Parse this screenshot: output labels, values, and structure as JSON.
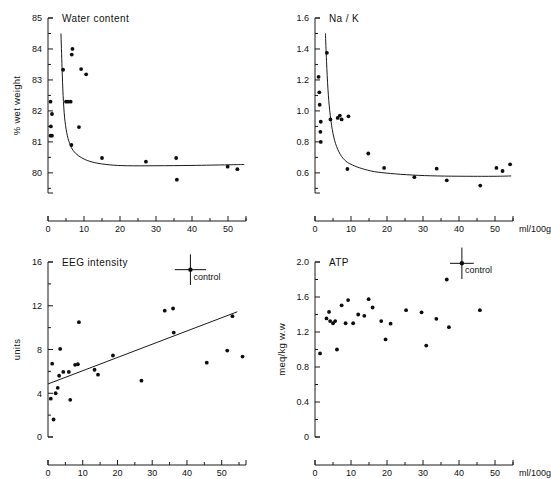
{
  "figure": {
    "width": 551,
    "height": 479,
    "background": "#ffffff",
    "ink": "#111111"
  },
  "chart_data": [
    {
      "panel": "top-left",
      "type": "scatter",
      "title": "Water content",
      "xlabel": "",
      "ylabel": "% wet weight",
      "xunit": "",
      "xlim": [
        0,
        55
      ],
      "ylim": [
        79.35,
        85
      ],
      "xticks": [
        0,
        10,
        20,
        30,
        40,
        50
      ],
      "xticklabels": [
        "0",
        "10",
        "20",
        "30",
        "40",
        "50"
      ],
      "xminorticks": [
        5,
        15,
        25,
        35,
        45,
        55
      ],
      "yticks": [
        80,
        81,
        82,
        83,
        84,
        85
      ],
      "yticklabels": [
        "80",
        "81",
        "82",
        "83",
        "84",
        "85"
      ],
      "yminorticks": [
        79.5,
        80.5,
        81.5,
        82.5,
        83.5,
        84.5
      ],
      "grid": false,
      "legend": "none",
      "points": [
        [
          0.7,
          82.3
        ],
        [
          1.1,
          81.9
        ],
        [
          0.8,
          81.5
        ],
        [
          0.7,
          81.2
        ],
        [
          1.1,
          81.2
        ],
        [
          4.2,
          83.33
        ],
        [
          5.0,
          82.3
        ],
        [
          5.6,
          82.3
        ],
        [
          6.3,
          82.3
        ],
        [
          6.8,
          84.0
        ],
        [
          6.6,
          83.82
        ],
        [
          6.5,
          80.9
        ],
        [
          9.2,
          83.35
        ],
        [
          10.6,
          83.18
        ],
        [
          8.6,
          81.48
        ],
        [
          15.0,
          80.48
        ],
        [
          27.2,
          80.36
        ],
        [
          35.6,
          80.48
        ],
        [
          35.8,
          79.78
        ],
        [
          49.9,
          80.2
        ],
        [
          52.6,
          80.12
        ]
      ],
      "fit": {
        "kind": "decay-curve",
        "description": "steep hyperbolic decay to plateau near 80.25",
        "asymptote": 80.25,
        "points": [
          [
            3.6,
            84.5
          ],
          [
            3.9,
            83.4
          ],
          [
            4.2,
            82.5
          ],
          [
            4.6,
            81.8
          ],
          [
            5.2,
            81.3
          ],
          [
            6.0,
            80.95
          ],
          [
            7.0,
            80.72
          ],
          [
            8.5,
            80.55
          ],
          [
            10.5,
            80.42
          ],
          [
            13.0,
            80.33
          ],
          [
            17.0,
            80.26
          ],
          [
            22.0,
            80.23
          ],
          [
            30.0,
            80.23
          ],
          [
            40.0,
            80.24
          ],
          [
            50.0,
            80.26
          ],
          [
            54.5,
            80.27
          ]
        ]
      }
    },
    {
      "panel": "top-right",
      "type": "scatter",
      "title": "Na / K",
      "xlabel": "ml/100g/min",
      "ylabel": "",
      "xunit": "ml/100g/min",
      "xlim": [
        0,
        55
      ],
      "ylim": [
        0.47,
        1.6
      ],
      "xticks": [
        0,
        10,
        20,
        30,
        40,
        50
      ],
      "xticklabels": [
        "0",
        "10",
        "20",
        "30",
        "40",
        "50"
      ],
      "xminorticks": [
        5,
        15,
        25,
        35,
        45,
        55
      ],
      "yticks": [
        0.6,
        0.8,
        1.0,
        1.2,
        1.4,
        1.6
      ],
      "yticklabels": [
        "0.6",
        "0.8",
        "1.0",
        "1.2",
        "1.4",
        "1.6"
      ],
      "yminorticks": [
        0.5,
        0.7,
        0.9,
        1.1,
        1.3,
        1.5
      ],
      "grid": false,
      "legend": "none",
      "points": [
        [
          1.0,
          1.22
        ],
        [
          1.2,
          1.12
        ],
        [
          1.3,
          1.04
        ],
        [
          1.6,
          0.93
        ],
        [
          1.5,
          0.865
        ],
        [
          1.6,
          0.8
        ],
        [
          3.3,
          1.375
        ],
        [
          4.3,
          0.945
        ],
        [
          6.3,
          0.955
        ],
        [
          6.9,
          0.97
        ],
        [
          7.4,
          0.945
        ],
        [
          9.3,
          0.965
        ],
        [
          9.0,
          0.625
        ],
        [
          14.8,
          0.725
        ],
        [
          19.2,
          0.632
        ],
        [
          27.6,
          0.572
        ],
        [
          33.8,
          0.627
        ],
        [
          36.6,
          0.552
        ],
        [
          45.9,
          0.518
        ],
        [
          50.4,
          0.632
        ],
        [
          52.1,
          0.612
        ],
        [
          54.2,
          0.655
        ]
      ],
      "fit": {
        "kind": "decay-curve",
        "description": "steep hyperbolic decay to plateau near 0.58",
        "asymptote": 0.58,
        "points": [
          [
            2.9,
            1.5
          ],
          [
            3.2,
            1.32
          ],
          [
            3.6,
            1.14
          ],
          [
            4.1,
            1.0
          ],
          [
            4.8,
            0.88
          ],
          [
            5.7,
            0.79
          ],
          [
            7.0,
            0.72
          ],
          [
            8.6,
            0.675
          ],
          [
            10.5,
            0.65
          ],
          [
            13.0,
            0.628
          ],
          [
            16.5,
            0.608
          ],
          [
            21.0,
            0.596
          ],
          [
            27.0,
            0.586
          ],
          [
            34.0,
            0.58
          ],
          [
            42.0,
            0.578
          ],
          [
            50.0,
            0.578
          ],
          [
            54.5,
            0.58
          ]
        ]
      }
    },
    {
      "panel": "bottom-left",
      "type": "scatter",
      "title": "EEG intensity",
      "xlabel": "",
      "ylabel": "units",
      "xunit": "",
      "xlim": [
        0,
        57
      ],
      "ylim": [
        0,
        16
      ],
      "xticks": [
        0,
        10,
        20,
        30,
        40,
        50
      ],
      "xticklabels": [
        "0",
        "10",
        "20",
        "30",
        "40",
        "50"
      ],
      "xminorticks": [
        5,
        15,
        25,
        35,
        45,
        55
      ],
      "yticks": [
        0,
        4,
        8,
        12,
        16
      ],
      "yticklabels": [
        "0",
        "4",
        "8",
        "12",
        "16"
      ],
      "yminorticks": [
        2,
        6,
        10,
        14
      ],
      "grid": false,
      "legend": "control marker, top right",
      "points": [
        [
          0.8,
          3.5
        ],
        [
          1.2,
          6.7
        ],
        [
          1.6,
          1.6
        ],
        [
          2.2,
          4.0
        ],
        [
          2.8,
          4.5
        ],
        [
          3.2,
          5.6
        ],
        [
          3.5,
          8.05
        ],
        [
          4.4,
          5.95
        ],
        [
          6.0,
          5.95
        ],
        [
          6.4,
          3.4
        ],
        [
          7.8,
          6.6
        ],
        [
          8.6,
          6.65
        ],
        [
          8.9,
          10.5
        ],
        [
          13.4,
          6.15
        ],
        [
          14.4,
          5.7
        ],
        [
          18.7,
          7.45
        ],
        [
          26.9,
          5.15
        ],
        [
          33.6,
          11.55
        ],
        [
          36.0,
          11.75
        ],
        [
          36.2,
          9.55
        ],
        [
          45.7,
          6.8
        ],
        [
          51.6,
          7.9
        ],
        [
          53.1,
          11.05
        ],
        [
          56.0,
          7.35
        ]
      ],
      "fit": {
        "kind": "linear",
        "description": "rising regression line",
        "x0": 0.0,
        "y0": 4.85,
        "x1": 54.5,
        "y1": 11.45
      },
      "control": {
        "label": "control",
        "x": 41.0,
        "y": 15.3,
        "xerr": 4.5,
        "yerr": 1.4
      }
    },
    {
      "panel": "bottom-right",
      "type": "scatter",
      "title": "ATP",
      "xlabel": "ml/100g/min",
      "ylabel": "meq/kg w.w",
      "xunit": "ml/100g/min",
      "xlim": [
        0,
        55
      ],
      "ylim": [
        0,
        2.0
      ],
      "xticks": [
        0,
        10,
        20,
        30,
        40,
        50
      ],
      "xticklabels": [
        "0",
        "10",
        "20",
        "30",
        "40",
        "50"
      ],
      "xminorticks": [
        5,
        15,
        25,
        35,
        45,
        55
      ],
      "yticks": [
        0,
        0.4,
        0.8,
        1.2,
        1.6,
        2.0
      ],
      "yticklabels": [
        "0",
        "0.4",
        "0.8",
        "1.2",
        "1.6",
        "2.0"
      ],
      "yminorticks": [
        0.2,
        0.6,
        1.0,
        1.4,
        1.8
      ],
      "grid": false,
      "legend": "control marker, top right",
      "points": [
        [
          1.4,
          0.955
        ],
        [
          3.2,
          1.355
        ],
        [
          3.9,
          1.43
        ],
        [
          4.2,
          1.325
        ],
        [
          5.0,
          1.3
        ],
        [
          5.6,
          1.325
        ],
        [
          6.1,
          1.0
        ],
        [
          7.4,
          1.505
        ],
        [
          8.5,
          1.3
        ],
        [
          9.2,
          1.565
        ],
        [
          10.6,
          1.3
        ],
        [
          12.0,
          1.4
        ],
        [
          13.7,
          1.385
        ],
        [
          14.9,
          1.575
        ],
        [
          16.0,
          1.48
        ],
        [
          18.4,
          1.325
        ],
        [
          19.6,
          1.115
        ],
        [
          21.0,
          1.295
        ],
        [
          25.3,
          1.45
        ],
        [
          29.6,
          1.425
        ],
        [
          30.9,
          1.045
        ],
        [
          33.7,
          1.35
        ],
        [
          36.6,
          1.8
        ],
        [
          37.2,
          1.255
        ],
        [
          45.8,
          1.45
        ]
      ],
      "control": {
        "label": "control",
        "x": 40.8,
        "y": 1.985,
        "xerr": 3.3,
        "yerr": 0.18
      }
    }
  ]
}
